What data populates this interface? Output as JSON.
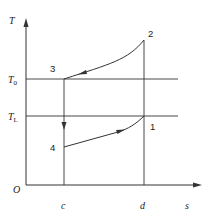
{
  "diagram": {
    "type": "T-s diagram (refrigeration cycle)",
    "axes": {
      "y_label": "T",
      "x_label": "s",
      "origin_label": "O"
    },
    "temperature_levels": [
      {
        "label": "T",
        "sub": "0",
        "name": "T0"
      },
      {
        "label": "T",
        "sub": "L",
        "name": "TL"
      }
    ],
    "entropy_marks": [
      {
        "label": "c"
      },
      {
        "label": "d"
      }
    ],
    "points": [
      {
        "label": "1"
      },
      {
        "label": "2"
      },
      {
        "label": "3"
      },
      {
        "label": "4"
      }
    ],
    "processes": [
      {
        "from": "1",
        "to": "2",
        "kind": "isentropic compression (vertical at d)"
      },
      {
        "from": "2",
        "to": "3",
        "kind": "heat rejection curve"
      },
      {
        "from": "3",
        "to": "4",
        "kind": "isentropic expansion (vertical at c)"
      },
      {
        "from": "4",
        "to": "1",
        "kind": "heat absorption curve"
      }
    ],
    "colors": {
      "line": "#333333",
      "text": "#222222"
    }
  }
}
